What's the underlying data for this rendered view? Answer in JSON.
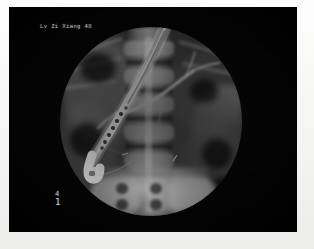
{
  "image": {
    "modality": "fluoroscopy-xray",
    "study": "ERCP",
    "view": "abdomen-anteroposterior",
    "field_shape": "circular-collimation"
  },
  "overlays": {
    "patient_label": "Lv Zi Xiang 48",
    "frame_marker_symbol": "4",
    "frame_marker_number": "1"
  },
  "colors": {
    "border": "#f4f4f2",
    "film_background": "#030303",
    "field_mid_gray": "#3b3b3b",
    "bone_bright": "#ebebeb",
    "contrast_duct": "#d8d8d8",
    "scope_bright": "#f2f2f2",
    "overlay_text": "#c3c3c3"
  },
  "anatomy": {
    "spine_label": "lumbar-spine",
    "sacrum_label": "sacrum",
    "pelvis_left_label": "left-iliac-bone",
    "pelvis_right_label": "right-iliac-bone",
    "bowel_gas_label": "bowel-gas"
  },
  "instrument": {
    "device": "duodenoscope",
    "path_label": "endoscope-shaft",
    "tip_label": "endoscope-tip",
    "articulation_label": "bending-section"
  },
  "contrast": {
    "duct_label": "common-bile-duct",
    "branch_label": "intrahepatic-branch",
    "wire_label": "guidewire-marker"
  },
  "vertebra_positions": [
    14,
    42,
    70,
    98,
    126
  ],
  "disc_positions": [
    33,
    61,
    89,
    117,
    145
  ],
  "foramen_positions": [
    {
      "x": 56,
      "y": 156
    },
    {
      "x": 56,
      "y": 172
    },
    {
      "x": 90,
      "y": 156
    },
    {
      "x": 90,
      "y": 172
    }
  ],
  "rib_positions": [
    {
      "x": 8,
      "y": 18,
      "w": 56,
      "r": -18
    },
    {
      "x": 4,
      "y": 36,
      "w": 58,
      "r": -14
    },
    {
      "x": 2,
      "y": 56,
      "w": 54,
      "r": -8
    },
    {
      "x": 118,
      "y": 20,
      "w": 54,
      "r": 16
    },
    {
      "x": 122,
      "y": 40,
      "w": 52,
      "r": 12
    }
  ]
}
